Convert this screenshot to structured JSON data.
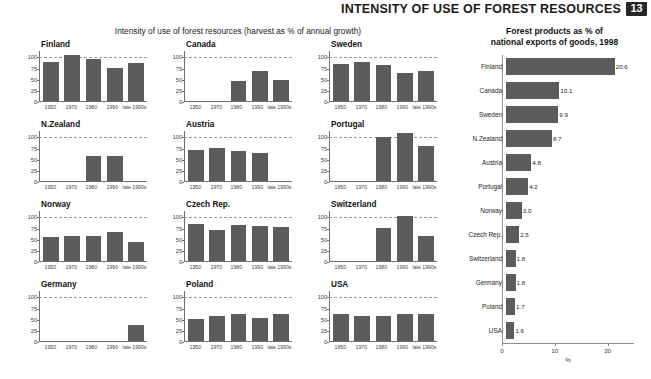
{
  "header": {
    "title": "INTENSITY OF USE OF FOREST RESOURCES",
    "page_number": "13"
  },
  "left_section": {
    "caption": "Intensity of use of forest resources (harvest as % of annual growth)",
    "y_ticks": [
      "100",
      "75",
      "50",
      "25",
      "0"
    ],
    "x_ticks": [
      "1950",
      "1970",
      "1980",
      "1990",
      "late 1990s"
    ]
  },
  "right_section": {
    "caption_line1": "Forest products as % of",
    "caption_line2": "national exports of goods, 1998",
    "x_ticks": [
      "0",
      "10",
      "20"
    ],
    "x_label": "%"
  },
  "colors": {
    "bar": "#5c5c5c",
    "axis": "#6e6e6e",
    "reference_line": "#9a9a9a",
    "badge_bg": "#262626",
    "text": "#111111"
  },
  "chart_data": [
    {
      "type": "bar",
      "title": "Intensity of use of forest resources (harvest as % of annual growth)",
      "subtype": "small-multiples",
      "categories": [
        "1950",
        "1970",
        "1980",
        "1990",
        "late 1990s"
      ],
      "xlabel": "",
      "ylabel": "",
      "ylim": [
        0,
        112
      ],
      "yticks": [
        0,
        25,
        50,
        75,
        100
      ],
      "reference_line": 100,
      "grid": false,
      "legend": "none",
      "panels": [
        {
          "name": "Finland",
          "values": [
            88,
            102,
            95,
            75,
            85
          ]
        },
        {
          "name": "Canada",
          "values": [
            null,
            null,
            44,
            68,
            46
          ]
        },
        {
          "name": "Sweden",
          "values": [
            84,
            88,
            81,
            63,
            67
          ]
        },
        {
          "name": "N.Zealand",
          "values": [
            null,
            null,
            55,
            57,
            null
          ]
        },
        {
          "name": "Austria",
          "values": [
            70,
            75,
            67,
            62,
            null
          ]
        },
        {
          "name": "Portugal",
          "values": [
            null,
            null,
            98,
            107,
            79
          ]
        },
        {
          "name": "Norway",
          "values": [
            54,
            57,
            56,
            65,
            42
          ]
        },
        {
          "name": "Czech Rep.",
          "values": [
            83,
            70,
            81,
            79,
            76
          ]
        },
        {
          "name": "Switzerland",
          "values": [
            null,
            null,
            73,
            101,
            56
          ]
        },
        {
          "name": "Germany",
          "values": [
            null,
            null,
            null,
            null,
            35
          ]
        },
        {
          "name": "Poland",
          "values": [
            49,
            57,
            61,
            51,
            61
          ]
        },
        {
          "name": "USA",
          "values": [
            61,
            56,
            56,
            61,
            60
          ]
        }
      ]
    },
    {
      "type": "bar",
      "orientation": "horizontal",
      "title": "Forest products as % of national exports of goods, 1998",
      "xlabel": "%",
      "ylabel": "",
      "xlim": [
        0,
        25
      ],
      "xticks": [
        0,
        10,
        20
      ],
      "grid": false,
      "legend": "none",
      "categories": [
        "Finland",
        "Canada",
        "Sweden",
        "N.Zealand",
        "Austria",
        "Portugal",
        "Norway",
        "Czech Rep.",
        "Switzerland",
        "Germany",
        "Poland",
        "USA"
      ],
      "values": [
        20.6,
        10.1,
        9.9,
        8.7,
        4.8,
        4.2,
        3.0,
        2.5,
        1.8,
        1.8,
        1.7,
        1.6
      ],
      "value_labels": [
        "20.6",
        "10.1",
        "9.9",
        "8.7",
        "4.8",
        "4.2",
        "3.0",
        "2.5",
        "1.8",
        "1.8",
        "1.7",
        "1.6"
      ]
    }
  ]
}
